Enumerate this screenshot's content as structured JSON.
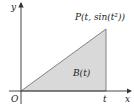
{
  "diagram": {
    "axes": {
      "x_label": "x",
      "y_label": "y",
      "origin_label": "O"
    },
    "point": {
      "name": "P",
      "coords": "(t, sin(t²))",
      "label": "P(t, sin(t²))"
    },
    "x_tick_label": "t",
    "region_label": "B(t)",
    "colors": {
      "fill": "#d9d9d9",
      "axis": "#333333",
      "edge": "#555555"
    }
  }
}
